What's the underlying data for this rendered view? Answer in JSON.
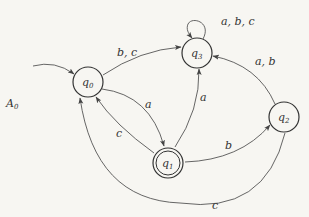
{
  "diagram": {
    "title": "A",
    "title_sub": "0",
    "type": "finite-automaton",
    "colors": {
      "background": "#f7f6f2",
      "stroke": "#333333",
      "edge": "#555555"
    },
    "nodes": [
      {
        "id": "q0",
        "label": "q",
        "sub": "0",
        "x": 88,
        "y": 82,
        "initial": true,
        "accepting": false
      },
      {
        "id": "q1",
        "label": "q",
        "sub": "1",
        "x": 168,
        "y": 163,
        "initial": false,
        "accepting": true
      },
      {
        "id": "q2",
        "label": "q",
        "sub": "2",
        "x": 284,
        "y": 117,
        "initial": false,
        "accepting": false
      },
      {
        "id": "q3",
        "label": "q",
        "sub": "3",
        "x": 197,
        "y": 53,
        "initial": false,
        "accepting": false
      }
    ],
    "edges": [
      {
        "from": "q0",
        "to": "q3",
        "label": "b, c"
      },
      {
        "from": "q3",
        "to": "q3",
        "label": "a, b, c"
      },
      {
        "from": "q0",
        "to": "q1",
        "label": "a"
      },
      {
        "from": "q1",
        "to": "q0",
        "label": "c"
      },
      {
        "from": "q1",
        "to": "q3",
        "label": "a"
      },
      {
        "from": "q1",
        "to": "q2",
        "label": "b"
      },
      {
        "from": "q2",
        "to": "q3",
        "label": "a, b"
      },
      {
        "from": "q2",
        "to": "q0",
        "label": "c"
      }
    ]
  }
}
